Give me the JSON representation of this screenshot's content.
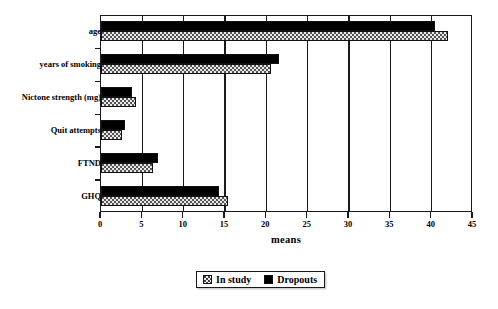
{
  "chart_data": {
    "type": "bar",
    "orientation": "horizontal",
    "title": "",
    "xlabel": "means",
    "ylabel": "",
    "xlim": [
      0,
      45
    ],
    "xticks": [
      0,
      5,
      10,
      15,
      20,
      25,
      30,
      35,
      40,
      45
    ],
    "grid": true,
    "grid_axis": "x",
    "legend_position": "bottom-center",
    "categories": [
      "age",
      "years of smoking",
      "Nictone strength (mg)",
      "Quit attempts",
      "FTND",
      "GHQ"
    ],
    "series": [
      {
        "name": "In study",
        "color": "#e8e8e8",
        "pattern": "dotted",
        "values": [
          42.0,
          20.6,
          4.2,
          2.5,
          6.3,
          15.4
        ]
      },
      {
        "name": "Dropouts",
        "color": "#000000",
        "pattern": "solid",
        "values": [
          40.4,
          21.5,
          3.7,
          2.9,
          6.9,
          14.3
        ]
      }
    ]
  },
  "legend": {
    "items": [
      {
        "label": "In study",
        "swatch": "instudy-swatch-icon"
      },
      {
        "label": "Dropouts",
        "swatch": "dropouts-swatch-icon"
      }
    ]
  }
}
